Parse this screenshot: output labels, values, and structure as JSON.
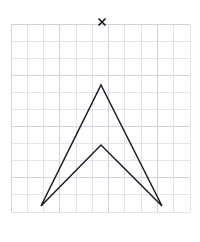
{
  "figure": {
    "title": "",
    "background_color": "#ffffff",
    "grid": {
      "label": "square-grid",
      "x_start": 11,
      "y_start": 24,
      "x_end": 190,
      "y_end": 212,
      "columns": 11,
      "rows": 11,
      "cell_width": 16.3,
      "cell_height": 17.1,
      "line_color": "#dcdce4",
      "visible": true
    },
    "stroke_color": "#1b1b23",
    "stroke_width": 1.5
  },
  "marker": {
    "name": "x-mark",
    "glyph": "×",
    "x": 102,
    "y": 22,
    "size": 7,
    "color": "#15151c",
    "description": "small x marker above the shape"
  },
  "shape": {
    "name": "chevron-arrowhead-polygon",
    "type": "polygon",
    "closed": true,
    "vertex_count": 4,
    "vertices": [
      {
        "label": "top-apex",
        "x": 101,
        "y": 85
      },
      {
        "label": "bottom-right-tip",
        "x": 162,
        "y": 206
      },
      {
        "label": "inner-notch",
        "x": 101,
        "y": 145
      },
      {
        "label": "bottom-left-tip",
        "x": 41,
        "y": 206
      }
    ],
    "path": "M 101 85 L 162 206 L 101 145 L 41 206 Z"
  },
  "chart_data": {
    "type": "scatter",
    "title": "",
    "xlabel": "",
    "ylabel": "",
    "grid": true,
    "legend": null,
    "series": [
      {
        "name": "arrowhead-outline",
        "kind": "polygon",
        "x": [
          101,
          162,
          101,
          41,
          101
        ],
        "y": [
          85,
          206,
          145,
          206,
          85
        ]
      },
      {
        "name": "x-marker",
        "kind": "marker",
        "x": [
          102
        ],
        "y": [
          22
        ]
      }
    ]
  }
}
